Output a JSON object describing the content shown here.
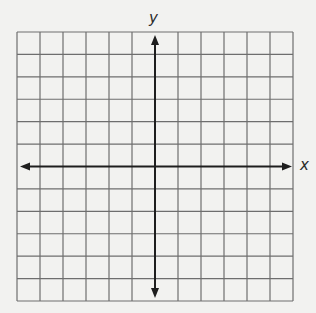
{
  "page": {
    "background": "#f2f2f0"
  },
  "grid": {
    "left": 17,
    "top": 32,
    "right": 293,
    "bottom": 301,
    "columns": 12,
    "rows": 12,
    "line_color": "#6e6e6e",
    "line_width": 1.2
  },
  "axes": {
    "origin_column": 6,
    "origin_row": 6,
    "color": "#1e1e1e",
    "line_width": 2,
    "x_label": "x",
    "y_label": "y",
    "x_arrow_left_end": 20,
    "x_arrow_right_end": 292,
    "y_arrow_top_end": 35,
    "y_arrow_bottom_end": 298
  },
  "labels": {
    "x_label_pos": {
      "left": 300,
      "top": 158
    },
    "y_label_pos": {
      "left": 149,
      "top": 11
    }
  }
}
